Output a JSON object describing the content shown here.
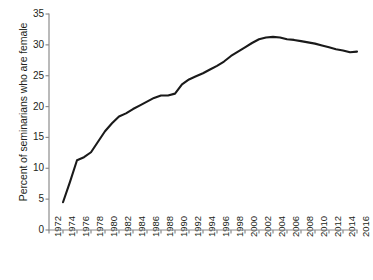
{
  "chart_data": {
    "type": "line",
    "title": "",
    "subtitle": "",
    "xlabel": "",
    "ylabel": "Percent of seminarians who are female",
    "xlim": [
      1972,
      2016
    ],
    "ylim": [
      0,
      35
    ],
    "yticks": [
      0,
      5,
      10,
      15,
      20,
      25,
      30,
      35
    ],
    "xticks": [
      1972,
      1974,
      1976,
      1978,
      1980,
      1982,
      1984,
      1986,
      1988,
      1990,
      1992,
      1994,
      1996,
      1998,
      2000,
      2002,
      2004,
      2006,
      2008,
      2010,
      2012,
      2014,
      2016
    ],
    "xtick_labels": [
      "1972",
      "1974",
      "1976",
      "1978",
      "1980",
      "1982",
      "1984",
      "1986",
      "1988",
      "1990",
      "1992",
      "1994",
      "1996",
      "1998",
      "2000",
      "2002",
      "2004",
      "2006",
      "2008",
      "2010",
      "2012",
      "2014",
      "2016"
    ],
    "grid": false,
    "legend": false,
    "legend_position": "none",
    "line_color": "#1a1a1a",
    "axis_color": "#8c8c8c",
    "series": [
      {
        "name": "Percent of seminarians who are female",
        "x": [
          1974,
          1975,
          1976,
          1977,
          1978,
          1979,
          1980,
          1981,
          1982,
          1983,
          1984,
          1985,
          1986,
          1987,
          1988,
          1989,
          1990,
          1991,
          1992,
          1993,
          1994,
          1995,
          1996,
          1997,
          1998,
          1999,
          2000,
          2001,
          2002,
          2003,
          2004,
          2005,
          2006,
          2007,
          2008,
          2009,
          2010,
          2011,
          2012,
          2013,
          2014,
          2015,
          2016
        ],
        "values": [
          4.5,
          7.8,
          11.3,
          11.8,
          12.6,
          14.3,
          16.0,
          17.3,
          18.4,
          18.9,
          19.6,
          20.2,
          20.8,
          21.4,
          21.8,
          21.8,
          22.1,
          23.6,
          24.4,
          24.9,
          25.4,
          26.0,
          26.6,
          27.3,
          28.2,
          28.9,
          29.6,
          30.3,
          30.9,
          31.2,
          31.3,
          31.2,
          30.9,
          30.8,
          30.6,
          30.4,
          30.2,
          29.9,
          29.6,
          29.3,
          29.1,
          28.8,
          28.9
        ]
      }
    ]
  },
  "geometry": {
    "plot_left": 49,
    "plot_right": 357,
    "plot_top": 14,
    "plot_bottom": 230
  }
}
